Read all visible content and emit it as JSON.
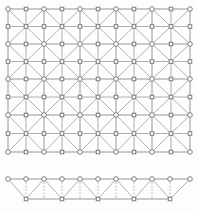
{
  "figure": {
    "background_color": "#fdfdfd",
    "width": 198,
    "height": 212
  },
  "style": {
    "edge_color": "#8a8a8a",
    "diagonal_color": "#9a9a9a",
    "dashed_color": "#9e9e9e",
    "node_stroke_color": "#6f6f6f",
    "node_fill_color": "#ffffff",
    "circle_radius": 2.3,
    "square_size": 3.6
  },
  "chart_data": {
    "type": "diagram",
    "panels": [
      {
        "name": "main-mesh",
        "description": "Rectangular grid of 5 x 4 quadrilateral cells, each cell split by both diagonals, with circular corner nodes and square mid-edge and cell-center nodes.",
        "x_positions": [
          8,
          44,
          80,
          116,
          152,
          190
        ],
        "y_positions": [
          9,
          44,
          79,
          115,
          152
        ],
        "columns": 5,
        "rows": 4,
        "corner_node_shape": "circle",
        "mid_node_shape": "square",
        "has_diagonals": true
      },
      {
        "name": "truss-strip",
        "description": "Lower horizontal truss strip: top chord of circular nodes at uniform spacing, bottom chord of square nodes offset by half a bay, connected by diagonal braces and dashed vertical droppers.",
        "top_x_positions": [
          8,
          26,
          44,
          62,
          80,
          98,
          116,
          134,
          152,
          170,
          190
        ],
        "top_y": 179,
        "bottom_x_positions": [
          26,
          62,
          98,
          134,
          170
        ],
        "bottom_y": 199,
        "top_node_shape": "circle",
        "bottom_node_shape": "square",
        "dropper_style": "dashed",
        "brace_style": "solid"
      }
    ]
  }
}
